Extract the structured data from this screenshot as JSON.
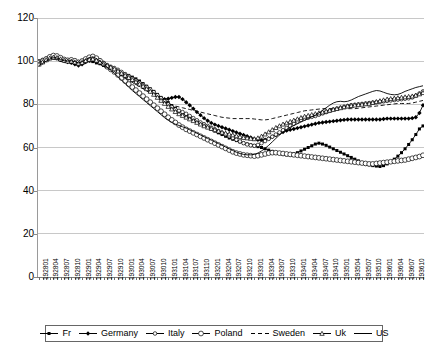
{
  "chart_data": {
    "type": "line",
    "title": "",
    "subtitle": "",
    "xlabel": "",
    "ylabel": "",
    "ylim": [
      0,
      120
    ],
    "yticks": [
      0,
      20,
      40,
      60,
      80,
      100,
      120
    ],
    "grid": true,
    "grid_axis": "y",
    "legend_position": "bottom",
    "x_tick_format": "YYYYMM",
    "x_tick_step_months": 3,
    "x": [
      "192801",
      "192802",
      "192803",
      "192804",
      "192805",
      "192806",
      "192807",
      "192808",
      "192809",
      "192810",
      "192811",
      "192812",
      "192901",
      "192902",
      "192903",
      "192904",
      "192905",
      "192906",
      "192907",
      "192908",
      "192909",
      "192910",
      "192911",
      "192912",
      "193001",
      "193002",
      "193003",
      "193004",
      "193005",
      "193006",
      "193007",
      "193008",
      "193009",
      "193010",
      "193011",
      "193012",
      "193101",
      "193102",
      "193103",
      "193104",
      "193105",
      "193106",
      "193107",
      "193108",
      "193109",
      "193110",
      "193111",
      "193112",
      "193201",
      "193202",
      "193203",
      "193204",
      "193205",
      "193206",
      "193207",
      "193208",
      "193209",
      "193210",
      "193211",
      "193212",
      "193301",
      "193302",
      "193303",
      "193304",
      "193305",
      "193306",
      "193307",
      "193308",
      "193309",
      "193310",
      "193311",
      "193312",
      "193401",
      "193402",
      "193403",
      "193404",
      "193405",
      "193406",
      "193407",
      "193408",
      "193409",
      "193410",
      "193411",
      "193412",
      "193501",
      "193502",
      "193503",
      "193504",
      "193505",
      "193506",
      "193507",
      "193508",
      "193509",
      "193510",
      "193511",
      "193512",
      "193601",
      "193602",
      "193603",
      "193604",
      "193605",
      "193606",
      "193607",
      "193608",
      "193609",
      "193610",
      "193611",
      "193612"
    ],
    "xticklabels": [
      "192801",
      "192804",
      "192807",
      "192810",
      "192901",
      "192904",
      "192907",
      "192910",
      "193001",
      "193004",
      "193007",
      "193010",
      "193101",
      "193104",
      "193107",
      "193110",
      "193201",
      "193204",
      "193207",
      "193210",
      "193301",
      "193304",
      "193307",
      "193310",
      "193401",
      "193404",
      "193407",
      "193410",
      "193501",
      "193504",
      "193507",
      "193510",
      "193601",
      "193604",
      "193607",
      "193610"
    ],
    "series": [
      {
        "name": "Fr",
        "marker": "filled-square-small",
        "line": "solid",
        "color": "#000000",
        "values": [
          99.0,
          100.2,
          101.0,
          101.8,
          102.0,
          101.4,
          100.6,
          100.2,
          100.4,
          100.8,
          100.2,
          99.6,
          100.4,
          101.2,
          100.6,
          99.8,
          99.2,
          98.8,
          98.0,
          97.4,
          96.8,
          96.2,
          95.4,
          94.6,
          94.0,
          93.4,
          92.6,
          91.8,
          90.8,
          89.6,
          88.4,
          87.2,
          86.0,
          84.6,
          83.2,
          82.0,
          80.8,
          79.4,
          78.2,
          77.0,
          76.0,
          75.0,
          74.0,
          73.0,
          72.0,
          71.0,
          70.0,
          69.2,
          68.4,
          67.6,
          66.8,
          66.0,
          65.2,
          64.4,
          63.8,
          63.2,
          62.6,
          62.0,
          61.6,
          61.2,
          60.8,
          60.4,
          60.0,
          59.4,
          58.8,
          58.2,
          57.6,
          57.2,
          56.8,
          56.6,
          56.6,
          57.0,
          57.6,
          58.4,
          59.2,
          60.0,
          60.8,
          61.6,
          62.0,
          61.6,
          61.0,
          60.2,
          59.4,
          58.6,
          57.8,
          57.0,
          56.2,
          55.4,
          54.6,
          53.8,
          53.0,
          52.4,
          52.0,
          51.6,
          51.4,
          51.2,
          51.6,
          52.4,
          53.4,
          54.6,
          56.0,
          57.6,
          59.4,
          61.4,
          63.6,
          66.0,
          68.6,
          70.0
        ]
      },
      {
        "name": "Germany",
        "marker": "filled-diamond",
        "line": "solid",
        "color": "#000000",
        "values": [
          98.4,
          99.4,
          100.4,
          101.2,
          101.6,
          101.2,
          100.6,
          100.0,
          99.6,
          99.2,
          98.6,
          98.0,
          98.6,
          99.6,
          100.2,
          100.6,
          100.0,
          99.2,
          98.4,
          97.6,
          96.8,
          96.0,
          95.0,
          94.0,
          93.0,
          92.0,
          91.0,
          90.0,
          89.0,
          88.0,
          87.0,
          86.0,
          85.0,
          84.0,
          83.0,
          82.4,
          82.6,
          83.0,
          83.4,
          83.4,
          82.4,
          81.0,
          79.6,
          78.0,
          76.4,
          75.0,
          73.6,
          72.4,
          71.4,
          70.6,
          70.0,
          69.4,
          68.8,
          68.2,
          67.6,
          67.0,
          66.4,
          65.8,
          65.2,
          64.6,
          64.0,
          63.6,
          63.4,
          63.6,
          64.2,
          65.0,
          65.8,
          66.6,
          67.2,
          67.8,
          68.2,
          68.6,
          69.0,
          69.4,
          69.8,
          70.2,
          70.6,
          71.0,
          71.4,
          71.6,
          71.8,
          72.0,
          72.2,
          72.4,
          72.6,
          72.8,
          73.0,
          73.0,
          73.0,
          73.0,
          73.0,
          73.0,
          73.0,
          73.0,
          73.0,
          73.0,
          73.2,
          73.4,
          73.4,
          73.4,
          73.4,
          73.4,
          73.4,
          73.4,
          73.6,
          74.0,
          76.0,
          79.6
        ]
      },
      {
        "name": "Italy",
        "marker": "open-circle-small",
        "line": "solid",
        "color": "#000000",
        "values": [
          100.0,
          100.6,
          101.2,
          101.8,
          102.2,
          102.0,
          101.4,
          100.8,
          100.4,
          100.2,
          100.0,
          99.6,
          99.6,
          100.4,
          101.0,
          101.4,
          101.0,
          100.2,
          99.2,
          98.2,
          97.4,
          96.8,
          96.0,
          95.0,
          94.0,
          93.0,
          92.0,
          91.0,
          90.0,
          89.0,
          88.0,
          86.8,
          85.6,
          84.2,
          82.8,
          81.4,
          80.0,
          78.8,
          77.6,
          77.0,
          76.4,
          75.6,
          74.6,
          73.6,
          72.6,
          71.6,
          70.8,
          70.0,
          69.2,
          68.4,
          67.6,
          66.8,
          66.0,
          65.2,
          64.4,
          63.6,
          62.8,
          62.0,
          61.4,
          61.0,
          60.8,
          61.2,
          62.0,
          63.0,
          64.0,
          65.0,
          66.0,
          67.0,
          68.0,
          69.0,
          70.0,
          71.0,
          72.0,
          72.8,
          73.4,
          73.8,
          74.2,
          74.6,
          75.2,
          75.8,
          76.4,
          77.0,
          77.6,
          78.0,
          78.4,
          78.8,
          79.2,
          79.6,
          79.8,
          80.0,
          80.2,
          80.4,
          80.6,
          80.8,
          81.0,
          81.2,
          81.4,
          81.6,
          81.8,
          82.0,
          82.2,
          82.4,
          82.6,
          82.8,
          83.2,
          84.0,
          85.0,
          86.0
        ]
      },
      {
        "name": "Poland",
        "marker": "open-circle-large",
        "line": "solid",
        "color": "#000000",
        "values": [
          99.2,
          100.0,
          101.0,
          102.0,
          102.6,
          102.4,
          101.6,
          100.8,
          100.4,
          100.6,
          100.2,
          99.4,
          100.0,
          101.0,
          101.8,
          102.2,
          101.4,
          100.2,
          98.8,
          97.4,
          96.2,
          95.0,
          93.6,
          92.2,
          90.8,
          89.4,
          88.0,
          86.6,
          85.2,
          83.8,
          82.4,
          81.0,
          79.6,
          78.2,
          76.8,
          75.4,
          74.0,
          72.8,
          71.6,
          70.4,
          69.4,
          68.4,
          67.6,
          66.8,
          66.0,
          65.2,
          64.4,
          63.6,
          62.8,
          62.0,
          61.2,
          60.4,
          59.6,
          58.8,
          58.0,
          57.4,
          57.0,
          56.6,
          56.4,
          56.2,
          56.0,
          56.2,
          56.6,
          57.0,
          57.4,
          57.6,
          57.6,
          57.4,
          57.2,
          57.0,
          56.8,
          56.6,
          56.4,
          56.2,
          56.0,
          55.8,
          55.6,
          55.4,
          55.2,
          55.0,
          54.8,
          54.6,
          54.4,
          54.2,
          54.0,
          53.8,
          53.6,
          53.4,
          53.2,
          53.0,
          52.8,
          52.6,
          52.4,
          52.4,
          52.6,
          52.8,
          53.0,
          53.2,
          53.4,
          53.6,
          53.8,
          54.0,
          54.2,
          54.6,
          55.0,
          55.4,
          55.8,
          56.4
        ]
      },
      {
        "name": "Sweden",
        "marker": "none",
        "line": "dashed",
        "color": "#000000",
        "values": [
          99.6,
          100.0,
          100.4,
          100.8,
          101.0,
          100.6,
          100.0,
          99.6,
          99.2,
          99.0,
          98.6,
          98.2,
          98.6,
          99.2,
          99.6,
          99.8,
          99.2,
          98.4,
          97.6,
          96.8,
          96.0,
          95.2,
          94.2,
          93.2,
          92.2,
          91.2,
          90.2,
          89.2,
          88.2,
          87.2,
          86.2,
          85.2,
          84.2,
          83.2,
          82.2,
          81.2,
          80.4,
          79.8,
          79.2,
          78.8,
          78.4,
          78.0,
          77.6,
          77.2,
          76.8,
          76.4,
          76.0,
          75.6,
          75.2,
          74.8,
          74.4,
          74.0,
          73.8,
          73.6,
          73.4,
          73.4,
          73.4,
          73.4,
          73.4,
          73.4,
          73.2,
          73.0,
          72.8,
          72.8,
          73.0,
          73.4,
          73.8,
          74.2,
          74.6,
          75.0,
          75.4,
          75.8,
          76.2,
          76.6,
          77.0,
          77.2,
          77.4,
          77.6,
          77.8,
          78.0,
          78.0,
          78.0,
          78.0,
          78.0,
          78.0,
          78.0,
          78.0,
          78.0,
          78.0,
          78.2,
          78.4,
          78.6,
          78.8,
          79.0,
          79.2,
          79.4,
          79.6,
          79.8,
          80.0,
          80.2,
          80.4,
          80.4,
          80.4,
          80.4,
          80.6,
          81.0,
          81.4,
          81.8
        ]
      },
      {
        "name": "Uk",
        "marker": "open-triangle-small",
        "line": "solid",
        "color": "#000000",
        "values": [
          98.6,
          99.6,
          100.6,
          101.4,
          101.8,
          101.6,
          101.0,
          100.4,
          100.0,
          100.0,
          99.6,
          99.0,
          99.4,
          100.2,
          100.8,
          101.0,
          100.4,
          99.6,
          98.8,
          98.0,
          97.2,
          96.4,
          95.4,
          94.4,
          93.4,
          92.4,
          91.4,
          90.4,
          89.4,
          88.4,
          87.2,
          86.0,
          84.6,
          83.2,
          81.8,
          80.4,
          79.0,
          77.8,
          76.6,
          75.6,
          74.8,
          74.0,
          73.2,
          72.4,
          71.6,
          70.8,
          70.0,
          69.4,
          68.8,
          68.2,
          67.6,
          67.0,
          66.6,
          66.2,
          65.8,
          65.4,
          65.0,
          64.6,
          64.4,
          64.2,
          64.0,
          64.4,
          65.2,
          66.2,
          67.2,
          68.2,
          69.2,
          70.0,
          70.8,
          71.4,
          72.0,
          72.6,
          73.2,
          73.8,
          74.4,
          74.8,
          75.2,
          75.6,
          76.0,
          76.4,
          76.8,
          77.2,
          77.6,
          78.0,
          78.4,
          78.8,
          79.2,
          79.4,
          79.6,
          79.8,
          80.0,
          80.2,
          80.4,
          80.8,
          81.2,
          81.6,
          82.0,
          82.4,
          82.6,
          82.8,
          83.0,
          83.2,
          83.4,
          83.6,
          83.8,
          84.2,
          84.8,
          85.4
        ]
      },
      {
        "name": "US",
        "marker": "none",
        "line": "solid",
        "color": "#000000",
        "values": [
          98.0,
          99.0,
          100.0,
          101.0,
          101.6,
          101.4,
          100.8,
          100.2,
          100.0,
          100.2,
          99.8,
          99.2,
          99.8,
          100.8,
          101.6,
          102.0,
          101.2,
          100.0,
          98.6,
          97.2,
          95.8,
          94.4,
          92.8,
          91.2,
          89.6,
          88.0,
          86.4,
          85.0,
          83.6,
          82.2,
          80.8,
          79.4,
          78.0,
          76.6,
          75.2,
          73.8,
          72.6,
          71.6,
          70.8,
          70.2,
          69.6,
          69.0,
          68.2,
          67.4,
          66.6,
          65.8,
          65.0,
          64.2,
          63.4,
          62.6,
          61.8,
          61.0,
          60.2,
          59.4,
          58.6,
          57.8,
          57.2,
          56.8,
          56.6,
          56.6,
          56.8,
          57.4,
          58.4,
          59.6,
          61.0,
          62.6,
          64.2,
          65.8,
          67.2,
          68.4,
          69.4,
          70.2,
          71.0,
          71.8,
          72.6,
          73.4,
          74.2,
          75.0,
          76.0,
          77.2,
          78.4,
          79.6,
          80.6,
          81.2,
          81.4,
          81.2,
          81.4,
          82.0,
          82.8,
          83.6,
          84.2,
          84.8,
          85.4,
          86.0,
          86.4,
          86.2,
          85.6,
          85.0,
          84.6,
          84.4,
          84.6,
          85.2,
          86.0,
          86.6,
          87.2,
          87.8,
          88.2,
          88.6
        ]
      }
    ]
  },
  "legend": {
    "items": [
      {
        "label": "Fr",
        "marker": "filled-square-small",
        "line": "solid"
      },
      {
        "label": "Germany",
        "marker": "filled-diamond",
        "line": "solid"
      },
      {
        "label": "Italy",
        "marker": "open-circle-small",
        "line": "solid"
      },
      {
        "label": "Poland",
        "marker": "open-circle-large",
        "line": "solid"
      },
      {
        "label": "Sweden",
        "marker": "none",
        "line": "dashed"
      },
      {
        "label": "Uk",
        "marker": "open-triangle-small",
        "line": "solid"
      },
      {
        "label": "US",
        "marker": "none",
        "line": "solid"
      }
    ]
  },
  "axes": {
    "y_labels": [
      "120",
      "100",
      "80",
      "60",
      "40",
      "20",
      "0"
    ]
  }
}
